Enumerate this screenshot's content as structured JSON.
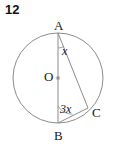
{
  "problem": {
    "number": "12"
  },
  "figure": {
    "type": "circle-geometry",
    "background": "#ffffff",
    "stroke_color": "#8c8c8c",
    "text_color": "#1a1a1a",
    "circle": {
      "center_x": 58,
      "center_y": 78,
      "radius": 45
    },
    "points": [
      {
        "name": "A",
        "label": "A",
        "x": 58,
        "y": 33,
        "label_x": 54,
        "label_y": 19
      },
      {
        "name": "B",
        "label": "B",
        "x": 58,
        "y": 123,
        "label_x": 54,
        "label_y": 129
      },
      {
        "name": "C",
        "label": "C",
        "x": 88,
        "y": 108,
        "label_x": 92,
        "label_y": 106
      },
      {
        "name": "O",
        "label": "O",
        "x": 58,
        "y": 78,
        "label_x": 44,
        "label_y": 70
      }
    ],
    "segments": [
      {
        "name": "AB",
        "from": "A",
        "to": "B"
      },
      {
        "name": "AC",
        "from": "A",
        "to": "C"
      },
      {
        "name": "BC",
        "from": "B",
        "to": "C"
      }
    ],
    "angles": [
      {
        "name": "angle-at-A",
        "vertex": "A",
        "label": "x",
        "label_x": 62,
        "label_y": 45
      },
      {
        "name": "angle-at-B",
        "vertex": "B",
        "label": "3x",
        "label_x": 60,
        "label_y": 103
      }
    ]
  }
}
